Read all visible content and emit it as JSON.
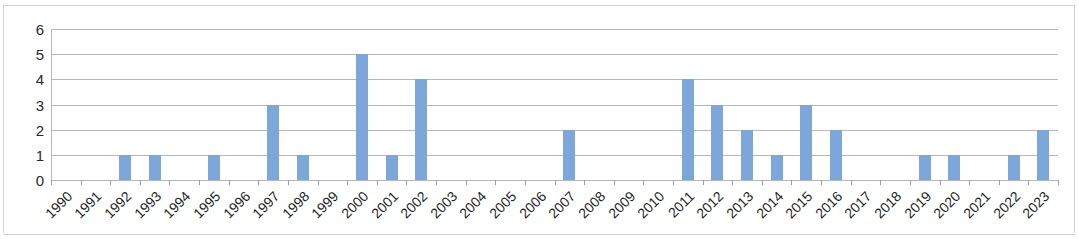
{
  "chart_data": {
    "type": "bar",
    "title": "",
    "subtitle": "",
    "xlabel": "",
    "ylabel": "",
    "ylim": [
      0,
      6
    ],
    "ytick_labels": [
      "0",
      "1",
      "2",
      "3",
      "4",
      "5",
      "6"
    ],
    "yticks": [
      0,
      1,
      2,
      3,
      4,
      5,
      6
    ],
    "grid": true,
    "legend": null,
    "legend_position": "none",
    "bar_color": "#7da7db",
    "gridline_color": "#b4b7bb",
    "categories": [
      "1990",
      "1991",
      "1992",
      "1993",
      "1994",
      "1995",
      "1996",
      "1997",
      "1998",
      "1999",
      "2000",
      "2001",
      "2002",
      "2003",
      "2004",
      "2005",
      "2006",
      "2007",
      "2008",
      "2009",
      "2010",
      "2011",
      "2012",
      "2013",
      "2014",
      "2015",
      "2016",
      "2017",
      "2018",
      "2019",
      "2020",
      "2021",
      "2022",
      "2023"
    ],
    "values": [
      0,
      0,
      1,
      1,
      0,
      1,
      0,
      3,
      1,
      0,
      5,
      1,
      4,
      0,
      0,
      0,
      0,
      2,
      0,
      0,
      0,
      4,
      3,
      2,
      1,
      3,
      2,
      0,
      0,
      1,
      1,
      0,
      1,
      2
    ]
  }
}
